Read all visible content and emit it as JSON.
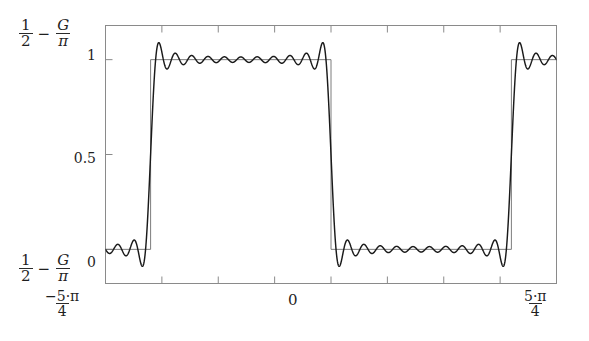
{
  "figure": {
    "kind": "function-plot",
    "colors": {
      "curve": "#1a1a1a",
      "reference": "#6e6e6e",
      "frame": "#8a8a8a",
      "text": "#1f1f1f",
      "background": "#ffffff"
    }
  },
  "axis_labels": {
    "y_top": {
      "numerator_1": "1",
      "denominator_1": "2",
      "operator": "−",
      "numerator_2": "G",
      "denominator_2": "π"
    },
    "y_bottom": {
      "numerator_1": "1",
      "denominator_1": "2",
      "operator": "−",
      "numerator_2": "G",
      "denominator_2": "π"
    },
    "x_left": {
      "numerator": "−5·π",
      "denominator": "4"
    },
    "x_mid": "0",
    "x_right": {
      "numerator": "5·π",
      "denominator": "4"
    }
  },
  "chart_data": {
    "type": "line",
    "title": "",
    "xlabel": "",
    "ylabel": "",
    "xlim": [
      -3.926990817,
      3.926990817
    ],
    "ylim": [
      -0.18,
      1.18
    ],
    "xtick_labels": [
      "-5·π/4",
      "0",
      "5·π/4"
    ],
    "xtick_values": [
      -3.926990817,
      0,
      3.926990817
    ],
    "ytick_labels": [
      "0",
      "0.5",
      "1"
    ],
    "ytick_values": [
      0,
      0.5,
      1
    ],
    "grid": false,
    "legend": false,
    "n_minor_xticks": 9,
    "minor_xtick_values": [
      -3.926990817,
      -2.945243113,
      -1.963495408,
      -0.981747704,
      0,
      0.981747704,
      1.963495408,
      2.945243113,
      3.926990817
    ],
    "series": [
      {
        "name": "square-wave-reference",
        "style": "thin-step",
        "color": "#6e6e6e",
        "description": "Ideal square wave: value 1 for -pi < x < 0, value 0 otherwise within window",
        "transitions": [
          {
            "x": -3.141592654,
            "from": 0,
            "to": 1
          },
          {
            "x": 0,
            "from": 1,
            "to": 0
          },
          {
            "x": 3.141592654,
            "from": 0,
            "to": 1
          }
        ],
        "levels": {
          "high": 1,
          "low": 0
        }
      },
      {
        "name": "fourier-partial-sum",
        "style": "thick-oscillating",
        "color": "#1a1a1a",
        "harmonics": 21,
        "description": "Partial sum of Fourier series; exhibits Gibbs overshoot of about 9% at each jump discontinuity",
        "overshoot_high": 1.09,
        "undershoot_low": -0.09,
        "mean_high": 1.0,
        "mean_low": 0.0
      }
    ]
  }
}
